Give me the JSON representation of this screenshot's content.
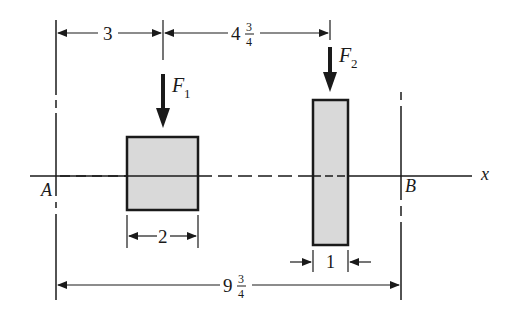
{
  "diagram": {
    "axis_label": "x",
    "point_a": "A",
    "point_b": "B",
    "forces": [
      {
        "symbol": "F",
        "subscript": "1"
      },
      {
        "symbol": "F",
        "subscript": "2"
      }
    ],
    "dimensions": {
      "a_to_f1": {
        "whole": "3"
      },
      "f1_to_f2": {
        "whole": "4",
        "num": "3",
        "den": "4"
      },
      "square_width": {
        "whole": "2"
      },
      "rect_width": {
        "whole": "1"
      },
      "total": {
        "whole": "9",
        "num": "3",
        "den": "4"
      }
    },
    "colors": {
      "line": "#1a1a1a",
      "fill": "#d9d9d9"
    }
  }
}
